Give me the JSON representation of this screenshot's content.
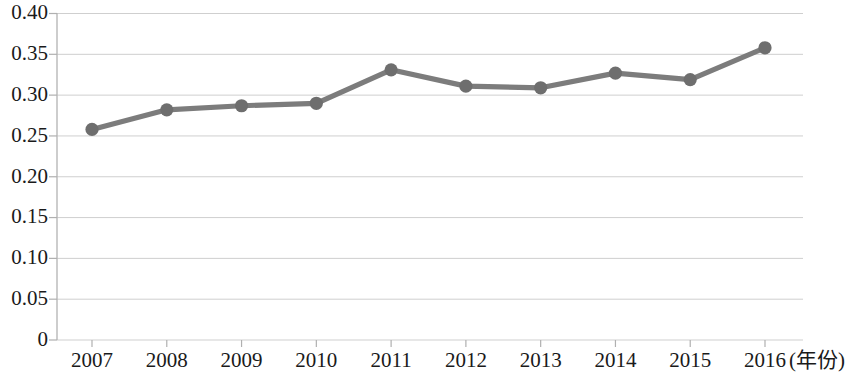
{
  "chart_data": {
    "type": "line",
    "title": "",
    "subtitle": "",
    "xlabel": "(年份)",
    "ylabel": "",
    "categories": [
      "2007",
      "2008",
      "2009",
      "2010",
      "2011",
      "2012",
      "2013",
      "2014",
      "2015",
      "2016"
    ],
    "values": [
      0.258,
      0.282,
      0.287,
      0.29,
      0.331,
      0.311,
      0.309,
      0.327,
      0.319,
      0.358
    ],
    "series": [
      {
        "name": "",
        "values": [
          0.258,
          0.282,
          0.287,
          0.29,
          0.331,
          0.311,
          0.309,
          0.327,
          0.319,
          0.358
        ]
      }
    ],
    "ylim": [
      0,
      0.4
    ],
    "y_tick_values": [
      0,
      0.05,
      0.1,
      0.15,
      0.2,
      0.25,
      0.3,
      0.35,
      0.4
    ],
    "y_tick_labels": [
      "0",
      "0.05",
      "0.10",
      "0.15",
      "0.20",
      "0.25",
      "0.30",
      "0.35",
      "0.40"
    ],
    "x_tick_labels": [
      "2007",
      "2008",
      "2009",
      "2010",
      "2011",
      "2012",
      "2013",
      "2014",
      "2015",
      "2016"
    ],
    "grid": true,
    "grid_axis": "y",
    "legend": false,
    "legend_position": "none",
    "markers": true,
    "annotations": [],
    "colors": {
      "line": "#7c7c7c",
      "marker": "#6e6e6e",
      "gridline": "#cfcfcf",
      "axis": "#b8b8b8",
      "text": "#1a1a1a",
      "background": "#ffffff"
    }
  }
}
